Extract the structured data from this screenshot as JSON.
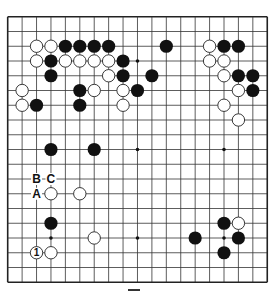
{
  "board": {
    "size": 19,
    "origin_x": 7.7,
    "origin_y": 16.75,
    "spacing_x": 14.42,
    "spacing_y": 14.75,
    "stone_radius": 6.6,
    "line_color": "#333333",
    "border_color": "#222222",
    "black_color": "#111111",
    "white_fill": "#ffffff",
    "white_stroke": "#222222",
    "star_points": [
      [
        3,
        3
      ],
      [
        3,
        9
      ],
      [
        3,
        15
      ],
      [
        9,
        3
      ],
      [
        9,
        9
      ],
      [
        9,
        15
      ],
      [
        15,
        3
      ],
      [
        15,
        9
      ],
      [
        15,
        15
      ]
    ],
    "visible_star_points": [
      [
        9,
        3
      ],
      [
        9,
        9
      ],
      [
        15,
        9
      ],
      [
        3,
        15
      ],
      [
        9,
        15
      ],
      [
        15,
        15
      ]
    ]
  },
  "stones": {
    "black": [
      [
        4,
        2
      ],
      [
        5,
        2
      ],
      [
        6,
        2
      ],
      [
        7,
        2
      ],
      [
        11,
        2
      ],
      [
        15,
        2
      ],
      [
        16,
        2
      ],
      [
        3,
        3
      ],
      [
        8,
        3
      ],
      [
        3,
        4
      ],
      [
        8,
        4
      ],
      [
        10,
        4
      ],
      [
        16,
        4
      ],
      [
        17,
        4
      ],
      [
        5,
        5
      ],
      [
        9,
        5
      ],
      [
        17,
        5
      ],
      [
        2,
        6
      ],
      [
        5,
        6
      ],
      [
        3,
        9
      ],
      [
        6,
        9
      ],
      [
        3,
        14
      ],
      [
        15,
        14
      ],
      [
        13,
        15
      ],
      [
        16,
        15
      ],
      [
        15,
        16
      ]
    ],
    "white": [
      [
        2,
        2
      ],
      [
        3,
        2
      ],
      [
        14,
        2
      ],
      [
        2,
        3
      ],
      [
        4,
        3
      ],
      [
        5,
        3
      ],
      [
        6,
        3
      ],
      [
        7,
        3
      ],
      [
        14,
        3
      ],
      [
        15,
        3
      ],
      [
        7,
        4
      ],
      [
        15,
        4
      ],
      [
        1,
        5
      ],
      [
        6,
        5
      ],
      [
        8,
        5
      ],
      [
        16,
        5
      ],
      [
        1,
        6
      ],
      [
        8,
        6
      ],
      [
        15,
        6
      ],
      [
        16,
        7
      ],
      [
        3,
        12
      ],
      [
        5,
        12
      ],
      [
        6,
        15
      ],
      [
        3,
        16
      ],
      [
        16,
        14
      ]
    ],
    "numbered": [
      {
        "x": 2,
        "y": 16,
        "color": "white",
        "label": "1"
      }
    ]
  },
  "labels": [
    {
      "x": 2,
      "y": 11,
      "text": "B"
    },
    {
      "x": 3,
      "y": 11,
      "text": "C"
    },
    {
      "x": 2,
      "y": 12,
      "text": "A"
    }
  ]
}
